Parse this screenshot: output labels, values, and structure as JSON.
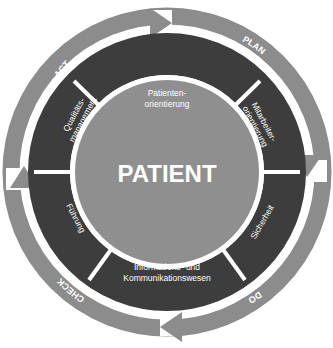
{
  "center": {
    "label": "PATIENT"
  },
  "cycle": {
    "plan": "PLAN",
    "do": "DO",
    "check": "CHECK",
    "act": "ACT"
  },
  "segments": [
    {
      "line1": "Patienten-",
      "line2": "orientierung"
    },
    {
      "line1": "Mitarbeiter-",
      "line2": "orientierung"
    },
    {
      "line1": "Sicherheit",
      "line2": ""
    },
    {
      "line1": "Informations- und",
      "line2": "Kommunikationswesen"
    },
    {
      "line1": "Führung",
      "line2": ""
    },
    {
      "line1": "Qualitäts-",
      "line2": "management"
    }
  ],
  "colors": {
    "outer_ring": "#8c8c8c",
    "segment_ring": "#3d3d3d",
    "center_disc": "#8f8f8f",
    "text": "#ffffff",
    "background": "#ffffff"
  }
}
